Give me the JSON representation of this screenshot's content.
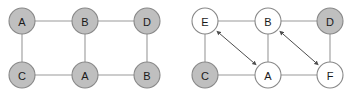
{
  "figure": {
    "background_color": "#ffffff",
    "panels": [
      {
        "id": "left-graph",
        "name": "left-graph",
        "nodes": [
          {
            "id": "L1",
            "label": "A",
            "x": 22,
            "y": 21,
            "r": 13,
            "fill": "#bfbfbf",
            "stroke": "#888888",
            "shaded": true
          },
          {
            "id": "L2",
            "label": "B",
            "x": 85,
            "y": 21,
            "r": 13,
            "fill": "#bfbfbf",
            "stroke": "#888888",
            "shaded": true
          },
          {
            "id": "L3",
            "label": "D",
            "x": 147,
            "y": 21,
            "r": 13,
            "fill": "#bfbfbf",
            "stroke": "#888888",
            "shaded": true
          },
          {
            "id": "L4",
            "label": "C",
            "x": 22,
            "y": 75,
            "r": 13,
            "fill": "#bfbfbf",
            "stroke": "#888888",
            "shaded": true
          },
          {
            "id": "L5",
            "label": "A",
            "x": 85,
            "y": 75,
            "r": 13,
            "fill": "#bfbfbf",
            "stroke": "#888888",
            "shaded": true
          },
          {
            "id": "L6",
            "label": "B",
            "x": 147,
            "y": 75,
            "r": 13,
            "fill": "#bfbfbf",
            "stroke": "#888888",
            "shaded": true
          }
        ],
        "edges": [
          {
            "from": "L1",
            "to": "L2",
            "kind": "plain"
          },
          {
            "from": "L2",
            "to": "L3",
            "kind": "plain"
          },
          {
            "from": "L1",
            "to": "L4",
            "kind": "plain"
          },
          {
            "from": "L2",
            "to": "L5",
            "kind": "plain"
          },
          {
            "from": "L3",
            "to": "L6",
            "kind": "plain"
          },
          {
            "from": "L4",
            "to": "L5",
            "kind": "plain"
          },
          {
            "from": "L5",
            "to": "L6",
            "kind": "plain"
          }
        ],
        "arrows": []
      },
      {
        "id": "right-graph",
        "name": "right-graph",
        "nodes": [
          {
            "id": "R1",
            "label": "E",
            "x": 205,
            "y": 21,
            "r": 13,
            "fill": "#ffffff",
            "stroke": "#888888",
            "shaded": false
          },
          {
            "id": "R2",
            "label": "B",
            "x": 268,
            "y": 21,
            "r": 13,
            "fill": "#ffffff",
            "stroke": "#888888",
            "shaded": false
          },
          {
            "id": "R3",
            "label": "D",
            "x": 330,
            "y": 21,
            "r": 13,
            "fill": "#bfbfbf",
            "stroke": "#888888",
            "shaded": true
          },
          {
            "id": "R4",
            "label": "C",
            "x": 205,
            "y": 75,
            "r": 13,
            "fill": "#bfbfbf",
            "stroke": "#888888",
            "shaded": true
          },
          {
            "id": "R5",
            "label": "A",
            "x": 268,
            "y": 75,
            "r": 13,
            "fill": "#ffffff",
            "stroke": "#888888",
            "shaded": false
          },
          {
            "id": "R6",
            "label": "F",
            "x": 330,
            "y": 75,
            "r": 13,
            "fill": "#ffffff",
            "stroke": "#888888",
            "shaded": false
          }
        ],
        "edges": [
          {
            "from": "R1",
            "to": "R2",
            "kind": "plain"
          },
          {
            "from": "R2",
            "to": "R3",
            "kind": "plain"
          },
          {
            "from": "R1",
            "to": "R4",
            "kind": "plain"
          },
          {
            "from": "R2",
            "to": "R5",
            "kind": "plain"
          },
          {
            "from": "R3",
            "to": "R6",
            "kind": "plain"
          },
          {
            "from": "R4",
            "to": "R5",
            "kind": "plain"
          },
          {
            "from": "R5",
            "to": "R6",
            "kind": "plain"
          }
        ],
        "arrows": [
          {
            "id": "A1",
            "from": "R1",
            "to": "R5",
            "kind": "double-headed",
            "color": "#4d4d4d"
          },
          {
            "id": "A2",
            "from": "R2",
            "to": "R6",
            "kind": "double-headed",
            "color": "#4d4d4d"
          }
        ]
      }
    ],
    "colors": {
      "node_shaded_fill": "#bfbfbf",
      "node_plain_fill": "#ffffff",
      "node_stroke": "#888888",
      "edge_stroke": "#9a9a9a",
      "arrow_stroke": "#4d4d4d",
      "label_text": "#1a1a1a"
    }
  }
}
